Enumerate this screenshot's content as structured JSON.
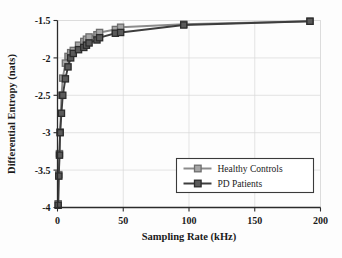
{
  "chart_data": {
    "type": "line",
    "title": "",
    "xlabel": "Sampling Rate (kHz)",
    "ylabel": "Differential Entropy (nats)",
    "xlim": [
      0,
      200
    ],
    "ylim": [
      -4,
      -1.5
    ],
    "xticks": [
      0,
      50,
      100,
      150,
      200
    ],
    "xticklabels": [
      "0",
      "50",
      "100",
      "150",
      "200"
    ],
    "yticks": [
      -1.5,
      -2,
      -2.5,
      -3,
      -3.5,
      -4
    ],
    "yticklabels": [
      "-1.5",
      "-2",
      "-2.5",
      "-3",
      "-3.5",
      "-4"
    ],
    "grid": true,
    "legend_position": "lower-right",
    "marker": "square",
    "series": [
      {
        "name": "Healthy Controls",
        "color": "#8c8c8c",
        "marker_fill": "#a6a6a6",
        "marker_edge": "#6e6e6e",
        "x": [
          0.5,
          1,
          1.5,
          2,
          3,
          4,
          6,
          8,
          10,
          12,
          16,
          20,
          22,
          24,
          30,
          32,
          44,
          48,
          96,
          192
        ],
        "y": [
          -3.95,
          -3.56,
          -3.28,
          -2.99,
          -2.5,
          -2.27,
          -2.07,
          -1.98,
          -1.93,
          -1.9,
          -1.83,
          -1.78,
          -1.75,
          -1.72,
          -1.69,
          -1.66,
          -1.62,
          -1.59,
          -1.55,
          -1.51
        ]
      },
      {
        "name": "PD Patients",
        "color": "#3d3d3d",
        "marker_fill": "#5a5a5a",
        "marker_edge": "#2b2b2b",
        "x": [
          0.5,
          1,
          1.5,
          2,
          3,
          4,
          6,
          8,
          10,
          12,
          16,
          20,
          22,
          24,
          30,
          32,
          44,
          48,
          96,
          192
        ],
        "y": [
          -3.97,
          -3.58,
          -3.3,
          -3.0,
          -2.74,
          -2.5,
          -2.28,
          -2.12,
          -2.0,
          -1.94,
          -1.89,
          -1.86,
          -1.83,
          -1.8,
          -1.76,
          -1.73,
          -1.67,
          -1.66,
          -1.56,
          -1.51
        ]
      }
    ]
  },
  "legend": {
    "entries": [
      {
        "label": "Healthy Controls"
      },
      {
        "label": "PD Patients"
      }
    ]
  }
}
